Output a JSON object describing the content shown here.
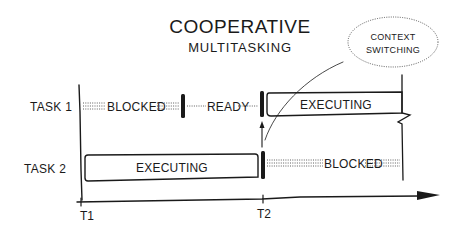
{
  "title": "COOPERATIVE",
  "subtitle": "MULTITASKING",
  "callout": {
    "line1": "CONTEXT",
    "line2": "SWITCHING"
  },
  "tasks": [
    {
      "label": "TASK 1",
      "segments": [
        {
          "state": "BLOCKED",
          "style": "dotted"
        },
        {
          "state": "READY",
          "style": "dotted-single"
        },
        {
          "state": "EXECUTING",
          "style": "box"
        }
      ]
    },
    {
      "label": "TASK 2",
      "segments": [
        {
          "state": "EXECUTING",
          "style": "box"
        },
        {
          "state": "BLOCKED",
          "style": "dotted"
        }
      ]
    }
  ],
  "timeline": {
    "ticks": [
      {
        "label": "T1"
      },
      {
        "label": "T2"
      }
    ]
  },
  "colors": {
    "ink": "#1a1a1a",
    "background": "#ffffff"
  }
}
